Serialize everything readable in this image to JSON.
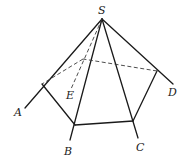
{
  "figure": {
    "type": "pyramid-with-pentagonal-section",
    "labels": {
      "S": "S",
      "A": "A",
      "B": "B",
      "C": "C",
      "D": "D",
      "E": "E"
    },
    "points": {
      "S": [
        102,
        19
      ],
      "A_end": [
        25,
        108
      ],
      "B_end": [
        70,
        140
      ],
      "C_end": [
        138,
        138
      ],
      "D_end": [
        173,
        84
      ],
      "E_end": [
        71,
        89
      ],
      "P_A": [
        42,
        84
      ],
      "P_B": [
        75,
        125
      ],
      "P_C": [
        133,
        121
      ],
      "P_D": [
        157,
        71
      ],
      "P_E": [
        83,
        59
      ]
    },
    "label_positions": {
      "S": [
        98,
        14
      ],
      "A": [
        14,
        116
      ],
      "B": [
        64,
        155
      ],
      "C": [
        136,
        151
      ],
      "D": [
        168,
        96
      ],
      "E": [
        66,
        99
      ]
    },
    "colors": {
      "line": "#1a1a1a",
      "dashed": "#3a3a3a",
      "background": "#ffffff"
    }
  }
}
